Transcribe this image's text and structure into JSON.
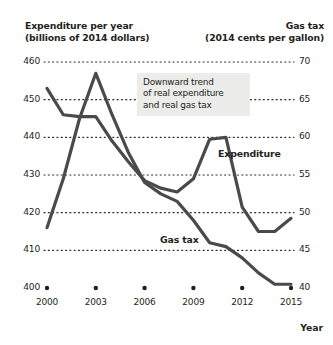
{
  "header": {
    "left_title_line1": "Expenditure per year",
    "left_title_line2": "(billions of 2014 dollars)",
    "right_title_line1": "Gas tax",
    "right_title_line2": "(2014 cents per gallon)"
  },
  "annotation": {
    "line1": "Downward trend",
    "line2": "of real expenditure",
    "line3": "and real gas tax"
  },
  "labels": {
    "expenditure": "Expenditure",
    "gas_tax": "Gas tax",
    "x_axis_title": "Year"
  },
  "chart_data": {
    "type": "line",
    "xlabel": "Year",
    "ylabel": "Expenditure per year (billions of 2014 dollars)",
    "y2label": "Gas tax (2014 cents per gallon)",
    "grid": true,
    "grid_style": "dotted",
    "legend": "inline-labels",
    "xlim": [
      2000,
      2015
    ],
    "ylim": [
      400,
      460
    ],
    "y2lim": [
      40,
      70
    ],
    "yticks": [
      400,
      410,
      420,
      430,
      440,
      450,
      460
    ],
    "y2ticks": [
      40,
      45,
      50,
      55,
      60,
      65,
      70
    ],
    "xticks": [
      2000,
      2003,
      2006,
      2009,
      2012,
      2015
    ],
    "xtick_marker": "dot",
    "x": [
      2000,
      2001,
      2002,
      2003,
      2004,
      2005,
      2006,
      2007,
      2008,
      2009,
      2010,
      2011,
      2012,
      2013,
      2014,
      2015
    ],
    "series": [
      {
        "name": "Expenditure",
        "axis": "left",
        "units": "billions of 2014 dollars",
        "color": "#4a4a4a",
        "values": [
          453.0,
          446.0,
          445.5,
          445.5,
          439.0,
          433.5,
          428.5,
          426.5,
          425.5,
          429.0,
          439.5,
          440.0,
          421.5,
          415.0,
          415.0,
          418.5
        ]
      },
      {
        "name": "Gas tax",
        "axis": "right",
        "units": "2014 cents per gallon",
        "color": "#4a4a4a",
        "values": [
          48.0,
          54.5,
          62.5,
          68.5,
          63.0,
          58.0,
          54.0,
          52.5,
          51.5,
          49.0,
          46.0,
          45.5,
          44.0,
          42.0,
          40.5,
          40.5
        ]
      }
    ]
  }
}
